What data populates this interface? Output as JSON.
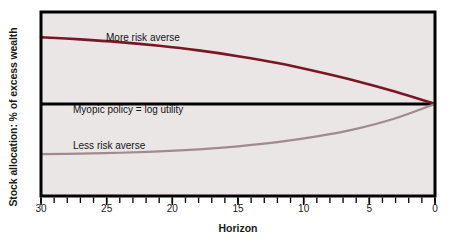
{
  "figure": {
    "background_color": "#ffffff",
    "plot_background_color": "#eae6e6",
    "frame_color": "#000000"
  },
  "chart_data": {
    "type": "line",
    "title": "",
    "xlabel": "Horizon",
    "ylabel": "Stock allocation: % of excess wealth",
    "xlim": [
      30,
      0
    ],
    "xtick_labels": [
      "30",
      "25",
      "20",
      "15",
      "10",
      "5",
      "0"
    ],
    "xticks": [
      30,
      25,
      20,
      15,
      10,
      5,
      0
    ],
    "x_axis_direction": "descending",
    "minor_tick_interval": 1,
    "ylim": [
      -40,
      40
    ],
    "ytick_labels": [],
    "grid": false,
    "legend_position": "inline-annotations",
    "baseline": {
      "label": "Myopic policy = log utility",
      "value": 0,
      "color": "#000000",
      "width_px": 3
    },
    "series": [
      {
        "name": "More risk averse",
        "color": "#7a1626",
        "x": [
          30,
          27,
          24,
          21,
          18,
          15,
          12,
          9,
          6,
          3,
          0
        ],
        "values": [
          29.0,
          28.1,
          26.9,
          25.3,
          23.3,
          20.8,
          17.8,
          14.1,
          10.0,
          5.3,
          0.0
        ]
      },
      {
        "name": "Less risk averse",
        "color": "#a08a8f",
        "x": [
          30,
          27,
          24,
          21,
          18,
          15,
          12,
          9,
          6,
          3,
          0
        ],
        "values": [
          -21.8,
          -21.6,
          -21.2,
          -20.6,
          -19.7,
          -18.4,
          -16.6,
          -14.1,
          -10.8,
          -6.2,
          0.0
        ]
      }
    ],
    "annotations": [
      {
        "text": "More risk averse",
        "series": "More risk averse"
      },
      {
        "text": "Myopic policy = log utility",
        "series": "baseline"
      },
      {
        "text": "Less risk averse",
        "series": "Less risk averse"
      }
    ]
  }
}
